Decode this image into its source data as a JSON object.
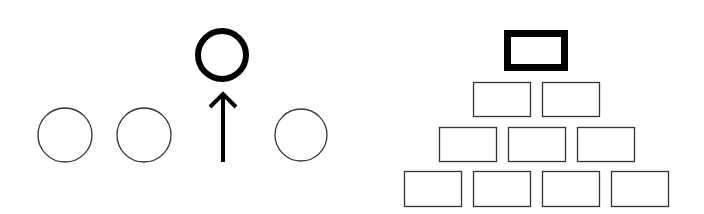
{
  "left_figure": {
    "description": "row of circles with one circle raised above an upward arrow",
    "circles": [
      {
        "cx": 65,
        "cy": 135,
        "r": 27
      },
      {
        "cx": 144,
        "cy": 135,
        "r": 27
      },
      {
        "cx": 301,
        "cy": 135,
        "r": 26
      }
    ],
    "highlighted_circle": {
      "cx": 222,
      "cy": 55,
      "r": 24
    },
    "arrow": {
      "x": 223,
      "y_start": 162,
      "y_end": 92
    },
    "stroke_color": "#333333",
    "highlight_color": "#000000"
  },
  "right_figure": {
    "description": "pyramid of rectangles with a bold rectangle at the top",
    "top_box": {
      "x": 504,
      "y": 30,
      "w": 64,
      "h": 41
    },
    "rows": [
      [
        {
          "x": 473,
          "y": 82,
          "w": 57,
          "h": 34
        },
        {
          "x": 542,
          "y": 82,
          "w": 57,
          "h": 34
        }
      ],
      [
        {
          "x": 439,
          "y": 127,
          "w": 57,
          "h": 34
        },
        {
          "x": 508,
          "y": 127,
          "w": 57,
          "h": 34
        },
        {
          "x": 577,
          "y": 127,
          "w": 57,
          "h": 34
        }
      ],
      [
        {
          "x": 404,
          "y": 171,
          "w": 57,
          "h": 35
        },
        {
          "x": 473,
          "y": 171,
          "w": 57,
          "h": 35
        },
        {
          "x": 542,
          "y": 171,
          "w": 57,
          "h": 35
        },
        {
          "x": 611,
          "y": 171,
          "w": 57,
          "h": 35
        }
      ]
    ]
  }
}
